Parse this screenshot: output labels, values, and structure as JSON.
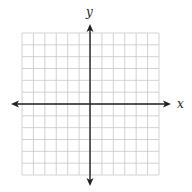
{
  "chart_data": {
    "type": "coordinate-grid",
    "title": "",
    "xlabel": "x",
    "ylabel": "y",
    "grid": true,
    "grid_cells_x": 12,
    "grid_cells_y": 12,
    "xlim": [
      -6,
      6
    ],
    "ylim": [
      -6,
      6
    ],
    "x_ticks_labeled": false,
    "y_ticks_labeled": false,
    "axes_arrows": [
      "left",
      "right",
      "up",
      "down"
    ],
    "series": []
  },
  "labels": {
    "x_axis": "x",
    "y_axis": "y"
  },
  "colors": {
    "grid_line": "#c8c8c8",
    "axis_line": "#222222",
    "background": "#ffffff"
  }
}
